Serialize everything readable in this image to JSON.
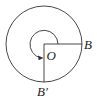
{
  "diagram": {
    "type": "rotation-angle-figure",
    "labels": {
      "center": "O",
      "initial_point": "B",
      "terminal_point": "B′"
    },
    "colors": {
      "stroke": "#333333",
      "background": "#ffffff"
    },
    "geometry": {
      "center": [
        44,
        44
      ],
      "outer_radius": 38,
      "inner_arc_radius": 14,
      "rotation_direction": "counterclockwise",
      "rotation_degrees": 270
    }
  }
}
